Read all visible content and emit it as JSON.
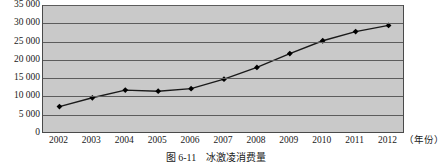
{
  "figure": {
    "caption_number": "图 6-11",
    "caption_title": "冰激凌消费量"
  },
  "chart_data": {
    "type": "line",
    "title": "",
    "xlabel": "（年份）",
    "ylabel": "",
    "categories": [
      "2002",
      "2003",
      "2004",
      "2005",
      "2006",
      "2007",
      "2008",
      "2009",
      "2010",
      "2011",
      "2012"
    ],
    "values": [
      7500,
      9900,
      12000,
      11700,
      12400,
      15000,
      18200,
      22000,
      25500,
      28000,
      29700
    ],
    "ylim": [
      0,
      35000
    ],
    "yticks": [
      0,
      5000,
      10000,
      15000,
      20000,
      25000,
      30000,
      35000
    ],
    "ytick_labels": [
      "0",
      "5 000",
      "10 000",
      "15 000",
      "20 000",
      "25 000",
      "30 000",
      "35 000"
    ],
    "grid": true,
    "legend": false,
    "marker": "diamond",
    "line_color": "#1a1a1a",
    "marker_color": "#000000",
    "plot_background": "#c9c9c9",
    "grid_color": "#5c5c5c",
    "axis_color": "#4a4a4a"
  }
}
